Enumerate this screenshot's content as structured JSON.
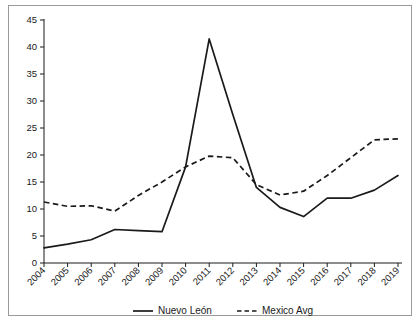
{
  "chart_data": {
    "type": "line",
    "title": "",
    "subtitle": "",
    "xlabel": "",
    "ylabel": "",
    "categories": [
      "2004",
      "2005",
      "2006",
      "2007",
      "2008",
      "2009",
      "2010",
      "2011",
      "2012",
      "2013",
      "2014",
      "2015",
      "2016",
      "2017",
      "2018",
      "2019"
    ],
    "ylim": [
      0,
      45
    ],
    "yticks": [
      0,
      5,
      10,
      15,
      20,
      25,
      30,
      35,
      40,
      45
    ],
    "grid": false,
    "legend_position": "bottom",
    "series": [
      {
        "name": "Nuevo León",
        "style": "solid",
        "color": "#1a1a1a",
        "values": [
          2.8,
          3.5,
          4.3,
          6.2,
          6.0,
          5.8,
          17.8,
          41.5,
          27.5,
          14.0,
          10.3,
          8.6,
          12.0,
          12.0,
          13.5,
          16.2
        ]
      },
      {
        "name": "Mexico Avg",
        "style": "dashed",
        "color": "#1a1a1a",
        "values": [
          11.3,
          10.5,
          10.6,
          9.6,
          12.5,
          15.0,
          17.8,
          19.8,
          19.5,
          14.5,
          12.6,
          13.3,
          16.2,
          19.5,
          22.8,
          23.0
        ]
      }
    ]
  },
  "legend": {
    "items": [
      {
        "label": "Nuevo León",
        "style": "solid"
      },
      {
        "label": "Mexico Avg",
        "style": "dashed"
      }
    ]
  }
}
